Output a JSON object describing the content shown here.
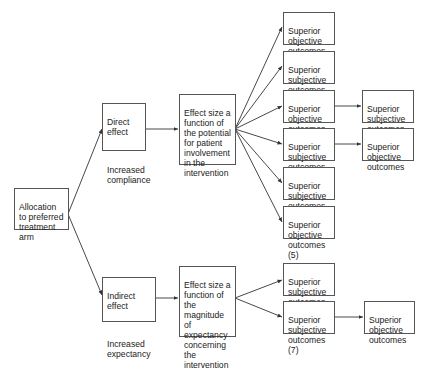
{
  "diagram": {
    "root": {
      "label": "Allocation to preferred treatment arm"
    },
    "direct": {
      "title": "Direct effect",
      "subtitle": "Increased compliance"
    },
    "indirect": {
      "title": "Indirect effect",
      "subtitle": "Increased expectancy"
    },
    "effect_top": {
      "label": "Effect size a function of the potential for patient involvement in the intervention"
    },
    "effect_bottom": {
      "label": "Effect size a function of the magnitude of expectancy concerning the intervention"
    },
    "outcomes": [
      {
        "label": "Superior objective outcomes (1)"
      },
      {
        "label": "Superior subjective outcomes (2)"
      },
      {
        "label": "Superior objective outcomes (3)"
      },
      {
        "label": "Superior subjective outcomes (4)"
      },
      {
        "label": "Superior subjective outcomes (5)"
      },
      {
        "label": "Superior objective outcomes (5)"
      },
      {
        "label": "Superior subjective outcomes (6)"
      },
      {
        "label": "Superior subjective outcomes (7)"
      }
    ],
    "secondary": [
      {
        "label": "Superior subjective outcomes"
      },
      {
        "label": "Superior objective outcomes"
      },
      {
        "label": "Superior objective outcomes"
      }
    ]
  }
}
